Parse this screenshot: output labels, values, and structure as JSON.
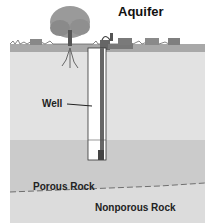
{
  "diagram": {
    "title": "Aquifer",
    "labels": {
      "well": "Well",
      "porous_rock": "Porous Rock",
      "nonporous_rock": "Nonporous Rock"
    },
    "layers": [
      {
        "name": "surface",
        "color": "#bdbdbd"
      },
      {
        "name": "soil",
        "color": "#e4e4e4"
      },
      {
        "name": "porous-rock",
        "color": "#c8c8c8"
      },
      {
        "name": "nonporous-rock",
        "color": "#dadada"
      }
    ],
    "elements": [
      "tree",
      "well-pump",
      "cattle",
      "well-pipe"
    ]
  }
}
